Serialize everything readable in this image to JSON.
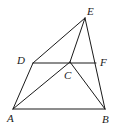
{
  "figure": {
    "type": "geometry",
    "stroke_color": "#1a1a1a",
    "background": "#ffffff",
    "points": {
      "A": {
        "label": "A",
        "x": 13,
        "y": 109,
        "lx": 7,
        "ly": 122
      },
      "B": {
        "label": "B",
        "x": 105,
        "y": 109,
        "lx": 102,
        "ly": 123
      },
      "C": {
        "label": "C",
        "x": 70,
        "y": 62,
        "lx": 64,
        "ly": 79
      },
      "D": {
        "label": "D",
        "x": 33,
        "y": 63,
        "lx": 17,
        "ly": 64
      },
      "E": {
        "label": "E",
        "x": 85,
        "y": 18,
        "lx": 87,
        "ly": 15
      },
      "F": {
        "label": "F",
        "x": 96,
        "y": 63,
        "lx": 100,
        "ly": 66
      }
    },
    "segments": [
      [
        "A",
        "B"
      ],
      [
        "A",
        "D"
      ],
      [
        "D",
        "E"
      ],
      [
        "E",
        "B"
      ],
      [
        "D",
        "F"
      ],
      [
        "A",
        "C"
      ],
      [
        "C",
        "B"
      ],
      [
        "E",
        "C"
      ]
    ]
  }
}
